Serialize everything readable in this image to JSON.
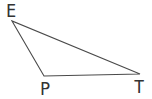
{
  "figure": {
    "type": "triangle",
    "background_color": "#ffffff",
    "line_color": "#4a4a4a",
    "label_color": "#333333",
    "vertices": [
      {
        "label": "E",
        "x": 12,
        "y": 21,
        "label_x": 11,
        "label_y": 17
      },
      {
        "label": "P",
        "x": 44,
        "y": 76,
        "label_x": 45,
        "label_y": 95
      },
      {
        "label": "T",
        "x": 140,
        "y": 74,
        "label_x": 139,
        "label_y": 93
      }
    ]
  }
}
